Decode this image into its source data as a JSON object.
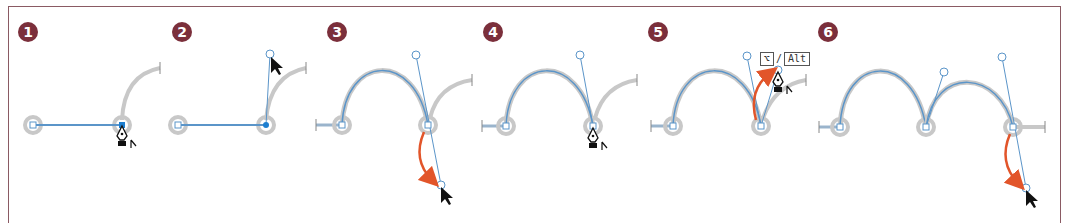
{
  "figure": {
    "border_color": "#8a5a63",
    "badge_color": "#7b2f3b",
    "path_color": "#5b95c9",
    "shadow_color": "#c8c8c8",
    "arrow_color": "#e2552a",
    "steps": [
      {
        "number": "1",
        "description": "Pen tool over anchor point at end of straight segment"
      },
      {
        "number": "2",
        "description": "Drag direction handle upward from anchor"
      },
      {
        "number": "3",
        "description": "Curve drawn; drag direction handle down"
      },
      {
        "number": "4",
        "description": "Pen tool positioned on curve anchor"
      },
      {
        "number": "5",
        "description": "Option/Alt-drag direction handle to convert point"
      },
      {
        "number": "6",
        "description": "Second curve drawn; drag handle down"
      }
    ],
    "modifier_keys": {
      "mac": "⌥",
      "separator": "/",
      "win": "Alt"
    }
  }
}
